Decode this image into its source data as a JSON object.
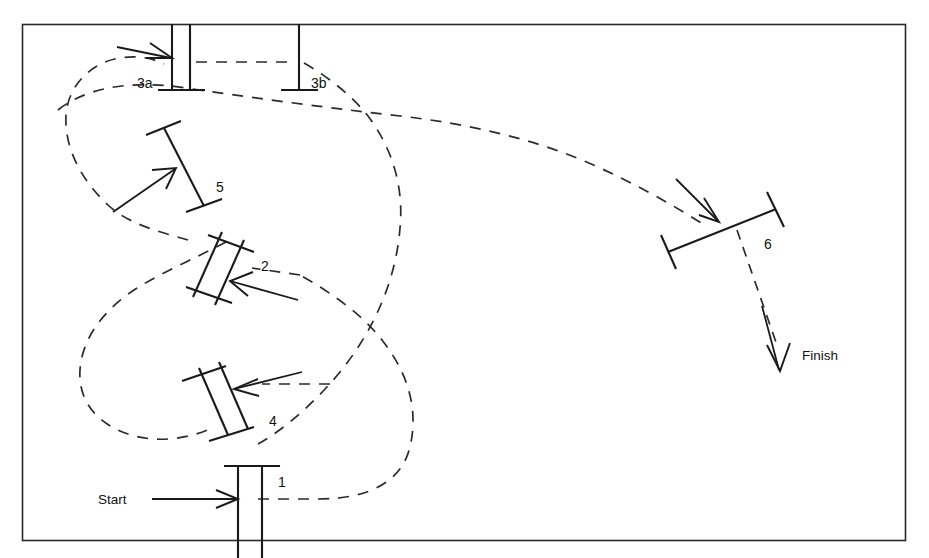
{
  "figure": {
    "kind": "equestrian-course-plan",
    "width": 929,
    "height": 558,
    "background_color": "#ffffff",
    "line_color": "#1a1a1a",
    "border_color": "#2a2a2a",
    "route_style": "dashed"
  },
  "terminus": {
    "start_label": "Start",
    "finish_label": "Finish"
  },
  "fences": [
    {
      "id": "1",
      "label": "1",
      "type": "double-rail-upright",
      "label_x": 278,
      "label_y": 487
    },
    {
      "id": "2",
      "label": "2",
      "type": "double-rail-diagonal",
      "label_x": 261,
      "label_y": 271
    },
    {
      "id": "3a",
      "label": "3a",
      "type": "double-rail-upright",
      "label_x": 137,
      "label_y": 88
    },
    {
      "id": "3b",
      "label": "3b",
      "type": "single-rail-upright",
      "label_x": 311,
      "label_y": 88
    },
    {
      "id": "4",
      "label": "4",
      "type": "double-rail-diagonal",
      "label_x": 269,
      "label_y": 426
    },
    {
      "id": "5",
      "label": "5",
      "type": "single-rail-diagonal",
      "label_x": 216,
      "label_y": 192
    },
    {
      "id": "6",
      "label": "6",
      "type": "single-rail-diagonal",
      "label_x": 764,
      "label_y": 249
    }
  ],
  "route_sequence": [
    "Start",
    "1",
    "2",
    "3a",
    "3b",
    "4",
    "5",
    "6",
    "Finish"
  ],
  "arrows": [
    {
      "name": "start-arrow",
      "points_to": "1",
      "direction": "right"
    },
    {
      "name": "arrow-to-2",
      "points_to": "2",
      "direction": "up-left"
    },
    {
      "name": "arrow-to-3a",
      "points_to": "3a",
      "direction": "right"
    },
    {
      "name": "arrow-to-4",
      "points_to": "4",
      "direction": "left"
    },
    {
      "name": "arrow-to-5",
      "points_to": "5",
      "direction": "up-right"
    },
    {
      "name": "arrow-to-6",
      "points_to": "6",
      "direction": "down-right"
    },
    {
      "name": "finish-arrow",
      "points_to": "Finish",
      "direction": "down"
    }
  ]
}
